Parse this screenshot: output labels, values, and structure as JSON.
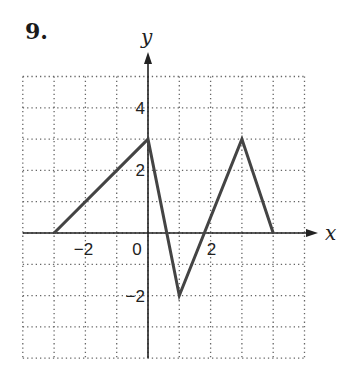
{
  "problem": {
    "number": "9."
  },
  "colors": {
    "axis": "#222222",
    "grid": "#666666",
    "line": "#444444",
    "background": "#ffffff"
  },
  "chart_data": {
    "type": "line",
    "title": "",
    "xlabel": "x",
    "ylabel": "y",
    "xlim": [
      -4,
      5
    ],
    "ylim": [
      -4,
      5
    ],
    "grid": true,
    "grid_style": "dotted",
    "x_ticks": [
      {
        "value": -2,
        "label": "−2"
      },
      {
        "value": 0,
        "label": "0"
      },
      {
        "value": 2,
        "label": "2"
      }
    ],
    "y_ticks": [
      {
        "value": 4,
        "label": "4"
      },
      {
        "value": 2,
        "label": "2"
      },
      {
        "value": -2,
        "label": "−2"
      }
    ],
    "series": [
      {
        "name": "f(x)",
        "x": [
          -3,
          0,
          1,
          3,
          4
        ],
        "y": [
          0,
          3,
          -2,
          3,
          0
        ]
      }
    ]
  }
}
